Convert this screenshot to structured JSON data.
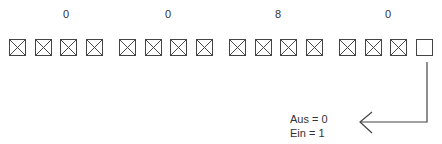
{
  "diagram": {
    "group_values": [
      "0",
      "0",
      "8",
      "0"
    ],
    "bit_states": [
      "checked",
      "checked",
      "checked",
      "checked",
      "checked",
      "checked",
      "checked",
      "checked",
      "checked",
      "checked",
      "checked",
      "checked",
      "checked",
      "checked",
      "checked",
      "empty"
    ],
    "legend": {
      "off_label": "Aus = 0",
      "on_label": "Ein =  1"
    }
  }
}
